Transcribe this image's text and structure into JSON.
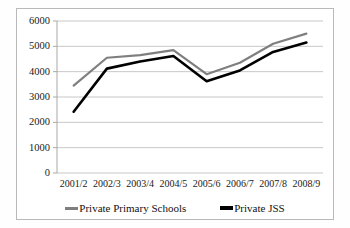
{
  "chart_data": {
    "type": "line",
    "title": "",
    "xlabel": "",
    "ylabel": "",
    "categories": [
      "2001/2",
      "2002/3",
      "2003/4",
      "2004/5",
      "2005/6",
      "2006/7",
      "2007/8",
      "2008/9"
    ],
    "series": [
      {
        "name": "Private Primary Schools",
        "color": "#7f7f7f",
        "values": [
          3450,
          4550,
          4650,
          4850,
          3900,
          4350,
          5100,
          5500
        ]
      },
      {
        "name": "Private JSS",
        "color": "#000000",
        "values": [
          2420,
          4120,
          4400,
          4620,
          3620,
          4050,
          4780,
          5150
        ]
      }
    ],
    "ylim": [
      0,
      6000
    ],
    "yticks": [
      0,
      1000,
      2000,
      3000,
      4000,
      5000,
      6000
    ],
    "ytick_labels": [
      "0",
      "1000",
      "2000",
      "3000",
      "4000",
      "5000",
      "6000"
    ],
    "grid": "horizontal",
    "legend_position": "bottom"
  },
  "legend": {
    "entries": [
      {
        "label": "Private Primary Schools",
        "marker": "gray-line-marker"
      },
      {
        "label": "Private JSS",
        "marker": "black-line-marker"
      }
    ]
  },
  "colors": {
    "primary_schools_line": "#7f7f7f",
    "jss_line": "#000000",
    "gridline": "#c8c8c8",
    "axis": "#a9a9a9",
    "frame": "#b9b9b9",
    "background": "#ffffff"
  }
}
